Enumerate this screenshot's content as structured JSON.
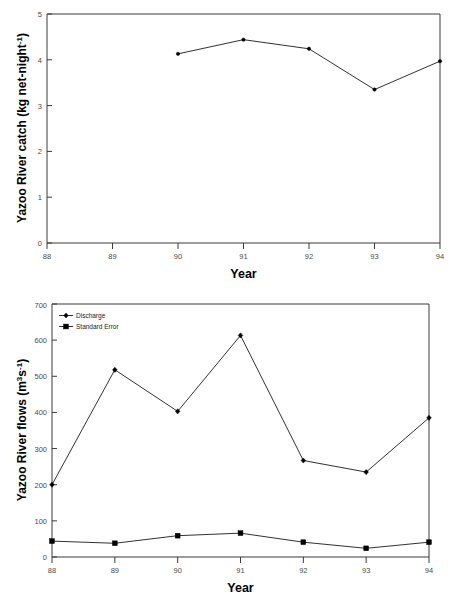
{
  "figure": {
    "x_axis_title": "Year",
    "charts": [
      {
        "id": "yazoo-river-catch",
        "ylabel_main": "Yazoo River catch (kg net-night",
        "ylabel_sup": "-1",
        "ylabel_tail": ")",
        "ylabel_full": "Yazoo River catch (kg net-night-1)",
        "xlabel": "Year",
        "y_ticks": [
          "0",
          "1",
          "2",
          "3",
          "4",
          "5"
        ],
        "x_ticks": [
          "88",
          "89",
          "90",
          "91",
          "92",
          "93",
          "94"
        ]
      },
      {
        "id": "yazoo-river-flows",
        "ylabel_main": "Yazoo River flows (m",
        "ylabel_sup1": "3",
        "ylabel_mid": "s",
        "ylabel_sup2": "-1",
        "ylabel_tail": ")",
        "ylabel_full": "Yazoo River flows (m3s-1)",
        "xlabel": "Year",
        "y_ticks": [
          "0",
          "100",
          "200",
          "300",
          "400",
          "500",
          "600",
          "700"
        ],
        "x_ticks": [
          "88",
          "89",
          "90",
          "91",
          "92",
          "93",
          "94"
        ],
        "legend": [
          {
            "label": "Discharge",
            "marker": "diamond"
          },
          {
            "label": "Standard Error",
            "marker": "square"
          }
        ]
      }
    ]
  },
  "chart_data": [
    {
      "type": "line",
      "id": "yazoo-river-catch",
      "title": "",
      "xlabel": "Year",
      "ylabel": "Yazoo River catch (kg net-night-1)",
      "xlim": [
        88,
        94
      ],
      "ylim": [
        0,
        5
      ],
      "xticks": [
        88,
        89,
        90,
        91,
        92,
        93,
        94
      ],
      "yticks": [
        0,
        1,
        2,
        3,
        4,
        5
      ],
      "grid": false,
      "legend": null,
      "x": [
        90,
        91,
        92,
        93,
        94
      ],
      "values": [
        4.13,
        4.44,
        4.24,
        3.35,
        3.97
      ],
      "series": [
        {
          "name": "Yazoo River catch",
          "x": [
            90,
            91,
            92,
            93,
            94
          ],
          "values": [
            4.13,
            4.44,
            4.24,
            3.35,
            3.97
          ],
          "marker": "dot"
        }
      ]
    },
    {
      "type": "line",
      "id": "yazoo-river-flows",
      "title": "",
      "xlabel": "Year",
      "ylabel": "Yazoo River flows (m3s-1)",
      "xlim": [
        88,
        94
      ],
      "ylim": [
        0,
        700
      ],
      "xticks": [
        88,
        89,
        90,
        91,
        92,
        93,
        94
      ],
      "yticks": [
        0,
        100,
        200,
        300,
        400,
        500,
        600,
        700
      ],
      "grid": false,
      "legend_position": "top-left",
      "x": [
        88,
        89,
        90,
        91,
        92,
        93,
        94
      ],
      "series": [
        {
          "name": "Discharge",
          "x": [
            88,
            89,
            90,
            91,
            92,
            93,
            94
          ],
          "values": [
            200,
            518,
            403,
            613,
            267,
            235,
            385
          ],
          "marker": "diamond"
        },
        {
          "name": "Standard Error",
          "x": [
            88,
            89,
            90,
            91,
            92,
            93,
            94
          ],
          "values": [
            44,
            38,
            59,
            66,
            41,
            24,
            41
          ],
          "marker": "square"
        }
      ]
    }
  ]
}
